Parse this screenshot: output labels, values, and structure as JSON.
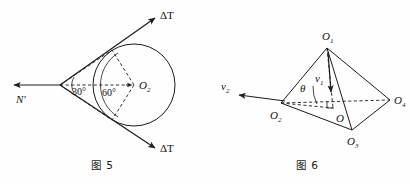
{
  "page": {
    "background_color": "#fefefe",
    "ink_color": "#1b1b1b"
  },
  "figures": [
    {
      "id": "figure-5",
      "caption": "图 5",
      "description": "Circle with two tangent lines meeting at an apex on the left; force vectors labeled Delta T along tangents and N prime pointing left.",
      "labels": {
        "vector_left": "N",
        "vector_left_prime": "′",
        "tangent_top": "ΔT",
        "tangent_bottom": "ΔT",
        "center": "O",
        "center_sub": "2",
        "apex_angle": "30°",
        "center_angle": "60°"
      },
      "geometry": {
        "circle_center_x": 134,
        "circle_center_y": 85,
        "circle_radius": 41,
        "apex_x": 60,
        "apex_y": 85
      }
    },
    {
      "id": "figure-6",
      "caption": "图 6",
      "description": "Tetrahedron O1-O2-O3-O4 with center O, vertical velocity v1 from apex and velocity v2 at vertex O2, angle theta at O2.",
      "labels": {
        "apex": "O",
        "apex_sub": "1",
        "left_vertex": "O",
        "left_vertex_sub": "2",
        "bottom_vertex": "O",
        "bottom_vertex_sub": "3",
        "right_vertex": "O",
        "right_vertex_sub": "4",
        "center": "O",
        "velocity_vertical": "v",
        "velocity_vertical_sub": "1",
        "velocity_left": "v",
        "velocity_left_sub": "2",
        "angle": "θ"
      },
      "geometry": {
        "apex_x": 122,
        "apex_y": 48,
        "left_x": 76,
        "left_y": 103,
        "right_x": 185,
        "right_y": 100,
        "bottom_x": 147,
        "bottom_y": 130,
        "center_x": 128,
        "center_y": 108
      }
    }
  ]
}
